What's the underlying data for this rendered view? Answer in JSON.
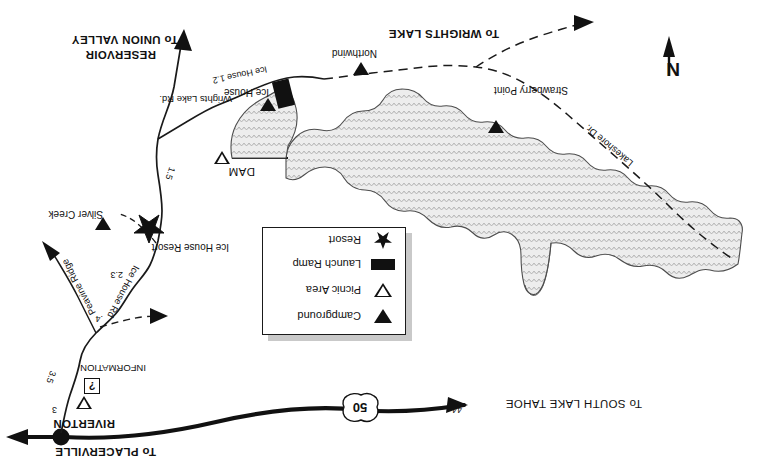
{
  "map": {
    "title": "Ice House Reservoir Recreation Area Map",
    "orientation_note": "artwork printed rotated 180 degrees",
    "north_arrow_label": "N",
    "background_color": "#ffffff",
    "water_fill_color": "#e8e8e8",
    "ink_color": "#111111",
    "shadow_color": "#c9c9c9"
  },
  "legend": {
    "items": [
      {
        "label": "Campground",
        "symbol": "filled-triangle-icon"
      },
      {
        "label": "Picnic Area",
        "symbol": "hollow-triangle-icon"
      },
      {
        "label": "Launch Ramp",
        "symbol": "filled-rectangle-icon"
      },
      {
        "label": "Resort",
        "symbol": "star-icon"
      }
    ]
  },
  "highways": {
    "shield_route": "50",
    "secondary_marker": "44"
  },
  "destinations": [
    {
      "text": "To PLACERVILLE"
    },
    {
      "text": "To SOUTH LAKE TAHOE"
    },
    {
      "text": "To WRIGHTS LAKE"
    },
    {
      "text": "To UNION VALLEY"
    },
    {
      "text": "RESERVOIR"
    }
  ],
  "places": [
    {
      "name": "RIVERTON",
      "kind": "town"
    },
    {
      "name": "INFORMATION",
      "kind": "information",
      "marker": "?"
    },
    {
      "name": "Ice House Resort",
      "kind": "resort"
    },
    {
      "name": "Silver Creek",
      "kind": "campground"
    },
    {
      "name": "Ice House",
      "kind": "campground"
    },
    {
      "name": "Northwind",
      "kind": "campground"
    },
    {
      "name": "Strawberry Point",
      "kind": "campground"
    },
    {
      "name": "DAM",
      "kind": "structure"
    }
  ],
  "roads": [
    {
      "name": "Ice House Rd",
      "kind": "paved"
    },
    {
      "name": "Peavine Ridge",
      "kind": "paved"
    },
    {
      "name": "Wrights Lake Rd.",
      "kind": "paved"
    },
    {
      "name": "Lakeshore Dr.",
      "kind": "dirt"
    }
  ],
  "mileages": [
    {
      "value": "3"
    },
    {
      "value": "3.5"
    },
    {
      "value": "2.3"
    },
    {
      "value": ".4"
    },
    {
      "value": "1.5"
    },
    {
      "value": "Ice House 1.2"
    }
  ]
}
